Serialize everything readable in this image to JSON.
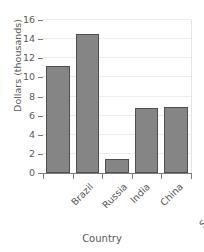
{
  "chart_data": {
    "type": "bar",
    "title": "",
    "xlabel": "Country",
    "ylabel": "Dollars (thousands)",
    "categories": [
      "Brazil",
      "Russia",
      "India",
      "China",
      "South Africa"
    ],
    "values": [
      11.2,
      14.5,
      1.5,
      6.8,
      6.9
    ],
    "ylim": [
      0,
      16
    ],
    "yticks": [
      0,
      2,
      4,
      6,
      8,
      10,
      12,
      14,
      16
    ],
    "ytick_labels": [
      "0",
      "2",
      "4",
      "6",
      "8",
      "10",
      "12",
      "14",
      "16"
    ],
    "grid": true,
    "legend": false,
    "bar_color": "#858585",
    "bar_edge_color": "#4f4f4f",
    "grid_color": "#ededed",
    "axis_color": "#7b7b7b",
    "text_color": "#58595b",
    "background": "#ffffff",
    "xtick_rotation": -45
  }
}
